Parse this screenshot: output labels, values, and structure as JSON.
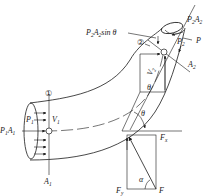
{
  "diagram": {
    "type": "fluid-momentum-bend",
    "labels": {
      "section1": "①",
      "section2": "②",
      "p1": "P",
      "p1_sub": "1",
      "v1": "V",
      "v1_sub": "1",
      "p1a1": "P",
      "p1a1_sub1": "1",
      "p1a1_A": "A",
      "p1a1_sub2": "1",
      "a1": "A",
      "a1_sub": "1",
      "p2a2": "P",
      "p2a2_sub1": "2",
      "p2a2_A": "A",
      "p2a2_sub2": "2",
      "p2a2sin": "P",
      "p2a2sin_sub1": "2",
      "p2a2sin_A": "A",
      "p2a2sin_sub2": "2",
      "p2a2sin_text": "sin θ",
      "p2": "P",
      "p2_sub": "2",
      "p_right": "P",
      "a2": "A",
      "a2_sub": "2",
      "v2": "V",
      "v2_sub": "2",
      "theta_upper": "θ",
      "theta_lower": "θ",
      "fx": "F",
      "fx_sub": "x",
      "fy": "F",
      "fy_sub": "y",
      "f": "F",
      "alpha": "α"
    }
  }
}
